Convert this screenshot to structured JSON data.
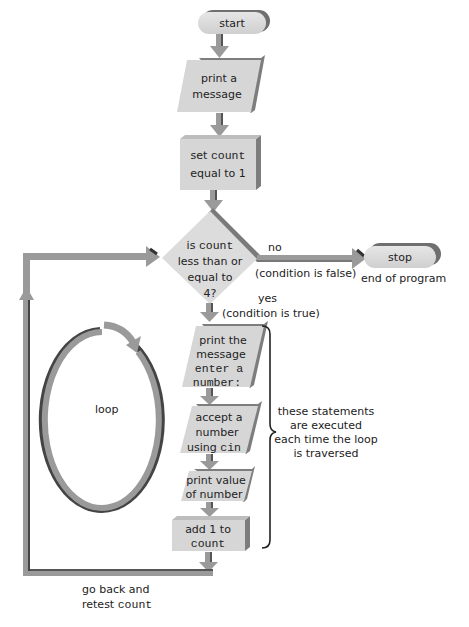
{
  "diagram": {
    "title": "",
    "colors": {
      "shape_fill": "#d9d9d9",
      "shape_side": "#8c8c8c",
      "arrow": "#9a9a9a",
      "arrow_dark": "#4a4a4a",
      "text": "#222222"
    },
    "nodes": {
      "start": {
        "type": "terminator",
        "label": "start"
      },
      "print_message": {
        "type": "io",
        "line1": "print a",
        "line2": "message"
      },
      "set_count": {
        "type": "process",
        "line1_prefix": "set ",
        "line1_code": "count",
        "line2": "equal to 1"
      },
      "decision": {
        "type": "decision",
        "line1_prefix": "is ",
        "line1_code": "count",
        "line2": "less than or",
        "line3": "equal to",
        "line4": "4?"
      },
      "stop": {
        "type": "terminator",
        "label": "stop"
      },
      "print_prompt": {
        "type": "io",
        "line1": "print the",
        "line2": "message",
        "line3_code": "enter a",
        "line4_code": "number:"
      },
      "accept_number": {
        "type": "io",
        "line1": "accept a",
        "line2": "number",
        "line3_prefix": "using ",
        "line3_code": "cin"
      },
      "print_value": {
        "type": "io",
        "line1": "print value",
        "line2": "of number"
      },
      "add_one": {
        "type": "process",
        "line1": "add 1 to",
        "line2_code": "count"
      }
    },
    "labels": {
      "no": "no",
      "no_condition": "(condition is false)",
      "yes": "yes",
      "yes_condition": "(condition is true)",
      "end_of_program": "end of program",
      "loop": "loop",
      "brace_note": [
        "these statements",
        "are executed",
        "each time the loop",
        "is traversed"
      ],
      "go_back_line1": "go back and",
      "go_back_line2_prefix": "retest ",
      "go_back_line2_code": "count"
    }
  }
}
